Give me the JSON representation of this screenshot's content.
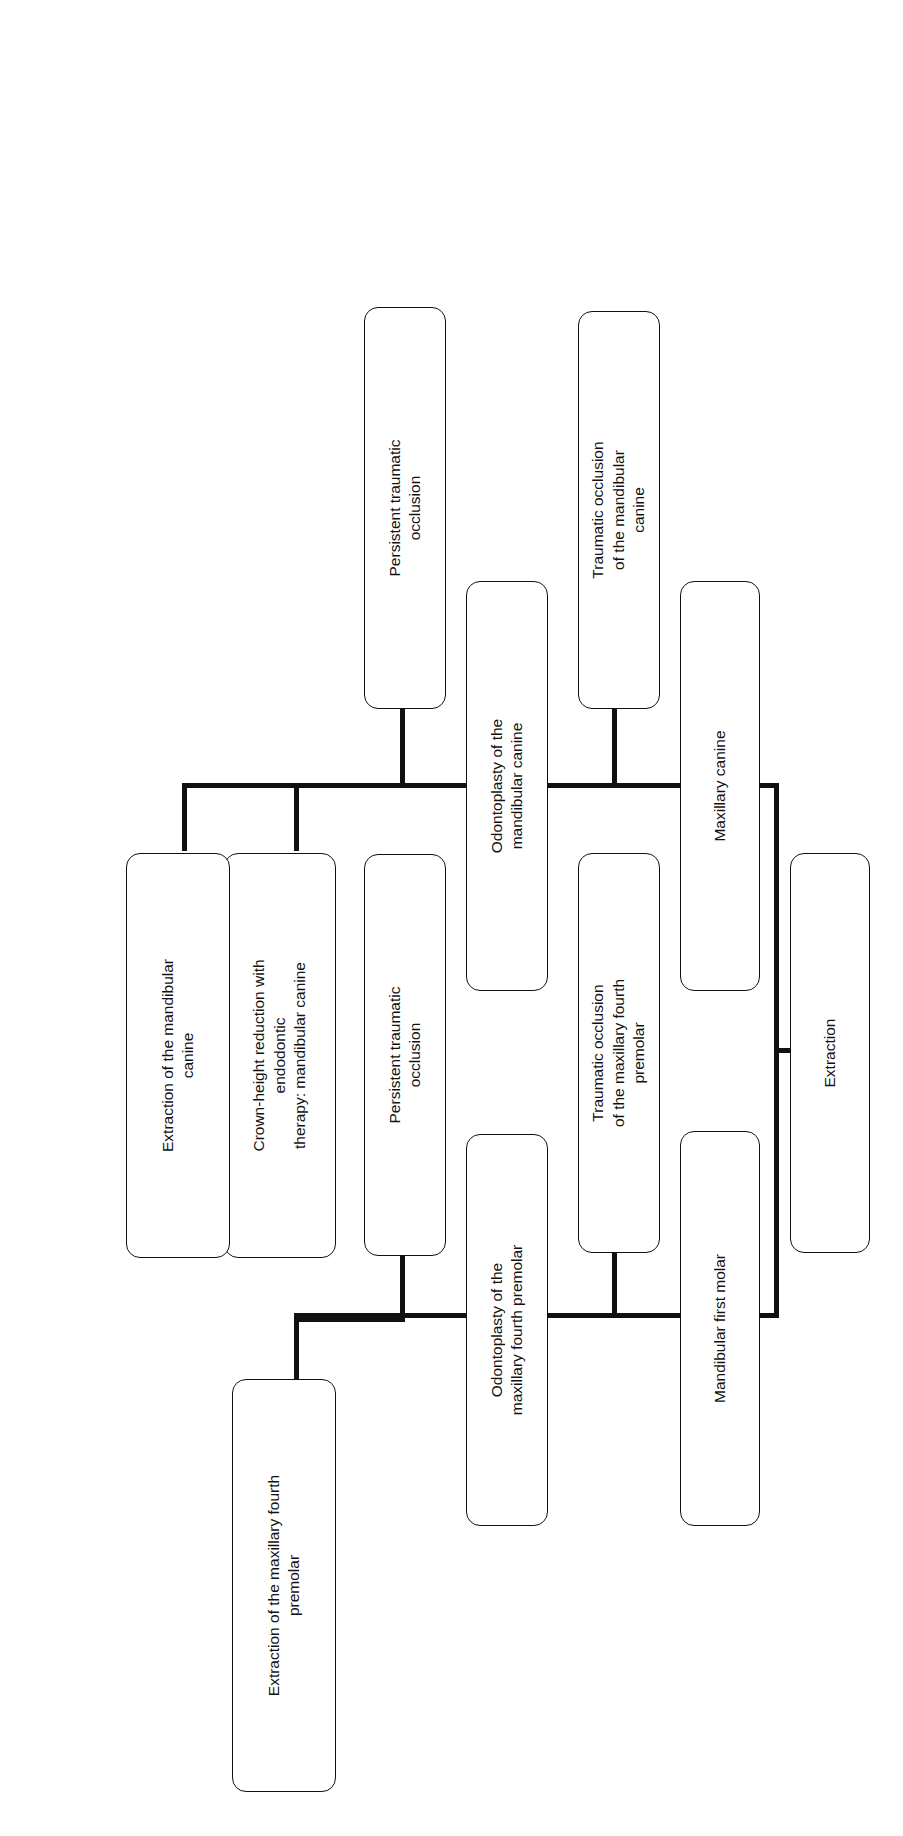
{
  "diagram": {
    "type": "flowchart",
    "orientation": "rotated-90-counterclockwise",
    "background_color": "#ffffff",
    "line_color": "#111111",
    "box_border_color": "#111111",
    "nodes": {
      "root": "Extraction",
      "branch_upper": "Mandibular first molar",
      "branch_lower": "Maxillary canine",
      "upper_outcome": "Traumatic occlusion\nof the maxillary fourth\npremolar",
      "upper_outcome_l1": "Traumatic occlusion",
      "upper_outcome_l2": "of the maxillary fourth",
      "upper_outcome_l3": "premolar",
      "upper_treatment_l1": "Odontoplasty of the",
      "upper_treatment_l2": "maxillary fourth premolar",
      "upper_persistent_l1": "Persistent traumatic",
      "upper_persistent_l2": "occlusion",
      "upper_final_l1": "Extraction of the maxillary fourth",
      "upper_final_l2": "premolar",
      "lower_outcome_l1": "Traumatic occlusion",
      "lower_outcome_l2": "of the mandibular",
      "lower_outcome_l3": "canine",
      "lower_treatment_l1": "Odontoplasty of the",
      "lower_treatment_l2": "mandibular canine",
      "lower_persistent_l1": "Persistent traumatic",
      "lower_persistent_l2": "occlusion",
      "lower_final_a_l1": "Crown-height reduction with",
      "lower_final_a_l2": "endodontic",
      "lower_final_a_l3": "therapy: mandibular canine",
      "lower_final_b_l1": "Extraction of the mandibular",
      "lower_final_b_l2": "canine"
    }
  }
}
